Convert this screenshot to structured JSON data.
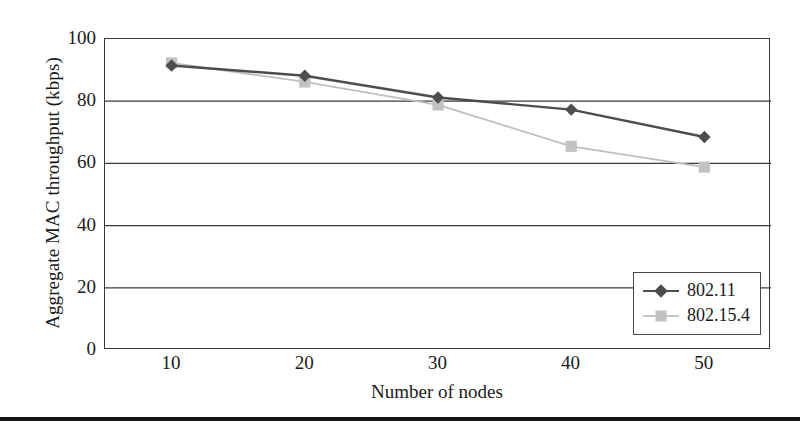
{
  "chart_data": {
    "type": "line",
    "title": "",
    "xlabel": "Number of nodes",
    "ylabel": "Aggregate MAC throughput (kbps)",
    "x": [
      10,
      20,
      30,
      40,
      50
    ],
    "xtick_labels": [
      "10",
      "20",
      "30",
      "40",
      "50"
    ],
    "ytick_labels": [
      "0",
      "20",
      "40",
      "60",
      "80",
      "100"
    ],
    "yticks": [
      0,
      20,
      40,
      60,
      80,
      100
    ],
    "xlim": [
      5,
      55
    ],
    "ylim": [
      0,
      100
    ],
    "grid": "horizontal",
    "legend_position": "bottom-right",
    "series": [
      {
        "name": "802.11",
        "values": [
          91.5,
          88.2,
          81.2,
          77.3,
          68.5
        ],
        "color": "#4d4d4d",
        "marker": "diamond"
      },
      {
        "name": "802.15.4",
        "values": [
          92.3,
          86.2,
          78.8,
          65.5,
          58.8
        ],
        "color": "#bfbfbf",
        "marker": "square"
      }
    ]
  },
  "axes": {
    "y_title": "Aggregate MAC throughput (kbps)",
    "x_title": "Number of nodes",
    "y_labels": [
      "100",
      "80",
      "60",
      "40",
      "20",
      "0"
    ],
    "x_labels": [
      "10",
      "20",
      "30",
      "40",
      "50"
    ]
  },
  "legend": {
    "entries": [
      {
        "label": "802.11"
      },
      {
        "label": "802.15.4"
      }
    ]
  },
  "colors": {
    "series_80211": "#4d4d4d",
    "series_802154": "#bfbfbf",
    "axis": "#3a3a3a",
    "text": "#1a1a1a"
  }
}
